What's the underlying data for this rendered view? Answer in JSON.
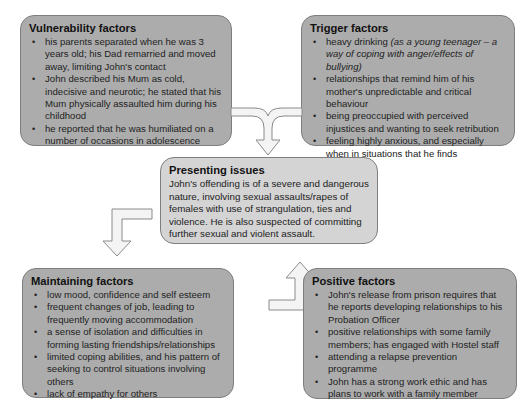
{
  "diagram": {
    "vulnerability": {
      "title": "Vulnerability factors",
      "items": [
        "his parents separated when he was 3 years old; his Dad remarried and moved away, limiting John's contact",
        "John described his Mum as cold, indecisive and neurotic; he stated that his Mum physically assaulted him during his childhood",
        "he reported that he was humiliated on a number of occasions in adolescence"
      ]
    },
    "trigger": {
      "title": "Trigger factors",
      "items": [
        {
          "text": "heavy drinking ",
          "italic": "(as a young teenager – a way of coping with anger/effects of bullying)"
        },
        {
          "text": "relationships that remind him of his mother's unpredictable and critical behaviour"
        },
        {
          "text": "being preoccupied with perceived injustices and wanting to seek retribution"
        },
        {
          "text": "feeling highly anxious, and especially when in situations that he finds unpleasant"
        }
      ]
    },
    "presenting": {
      "title": "Presenting issues",
      "text": "John's offending is of a severe and dangerous nature, involving sexual assaults/rapes of females with use of strangulation, ties and violence. He is also suspected of committing further sexual and violent assault."
    },
    "maintaining": {
      "title": "Maintaining factors",
      "items": [
        "low mood, confidence and self esteem",
        "frequent changes of job, leading to frequently moving accommodation",
        "a sense of isolation and difficulties in forming lasting friendships/relationships",
        "limited coping abilities, and his pattern of seeking to control situations involving others",
        "lack of empathy for others"
      ]
    },
    "positive": {
      "title": "Positive factors",
      "items": [
        "John's release from prison requires that he reports developing relationships to his Probation Officer",
        "positive relationships with some family members; has engaged with Hostel staff",
        "attending a relapse prevention programme",
        "John has a strong work ethic and has plans to work with a family member"
      ]
    },
    "colors": {
      "box_dark": "#acacac",
      "box_light": "#d4d4d4",
      "arrow_fill": "#f4f4f4",
      "border": "#7e7e7e"
    }
  }
}
